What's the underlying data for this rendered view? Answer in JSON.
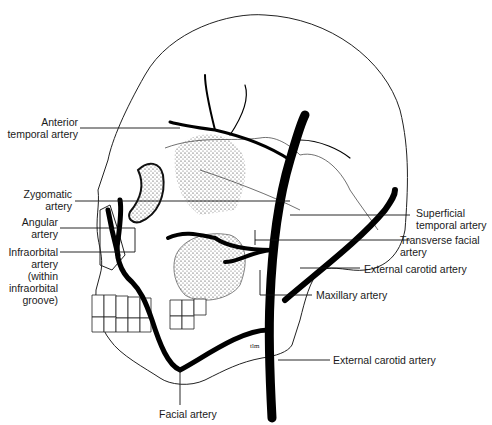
{
  "figure": {
    "labels_left": [
      {
        "line1": "Anterior",
        "line2": "temporal artery"
      },
      {
        "line1": "Zygomatic",
        "line2": "artery"
      },
      {
        "line1": "Angular",
        "line2": "artery"
      },
      {
        "line1": "Infraorbital",
        "line2": "artery",
        "line3": "(within",
        "line4": "infraorbital",
        "line5": "groove)"
      }
    ],
    "labels_right": [
      {
        "line1": "Superficial",
        "line2": "temporal artery"
      },
      {
        "line1": "Transverse facial",
        "line2": "artery"
      },
      {
        "line1": "External carotid artery"
      },
      {
        "line1": "Maxillary artery"
      },
      {
        "line1": "External carotid artery"
      }
    ],
    "labels_bottom": [
      {
        "line1": "Facial artery"
      }
    ],
    "signature": "tlm"
  }
}
